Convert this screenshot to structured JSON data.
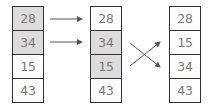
{
  "diagram": {
    "columns": [
      {
        "cells": [
          {
            "value": "28",
            "highlighted": true
          },
          {
            "value": "34",
            "highlighted": true
          },
          {
            "value": "15",
            "highlighted": false
          },
          {
            "value": "43",
            "highlighted": false
          }
        ]
      },
      {
        "cells": [
          {
            "value": "28",
            "highlighted": false
          },
          {
            "value": "34",
            "highlighted": true
          },
          {
            "value": "15",
            "highlighted": true
          },
          {
            "value": "43",
            "highlighted": false
          }
        ]
      },
      {
        "cells": [
          {
            "value": "28",
            "highlighted": false
          },
          {
            "value": "15",
            "highlighted": false
          },
          {
            "value": "34",
            "highlighted": false
          },
          {
            "value": "43",
            "highlighted": false
          }
        ]
      }
    ],
    "colors": {
      "highlight": "#dcdcdc",
      "border": "#333333",
      "text": "#7a7a7a",
      "arrow": "#555555"
    }
  }
}
